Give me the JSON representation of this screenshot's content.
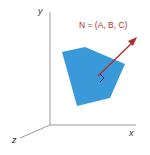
{
  "diagram": {
    "axes": {
      "x_label": "x",
      "y_label": "y",
      "z_label": "z"
    },
    "normal_label": "N = (A, B, C)",
    "colors": {
      "plane": "#3a9ad9",
      "normal": "#b0302a",
      "axis": "#888888",
      "right_angle_marker": "#1a2a6a"
    }
  }
}
